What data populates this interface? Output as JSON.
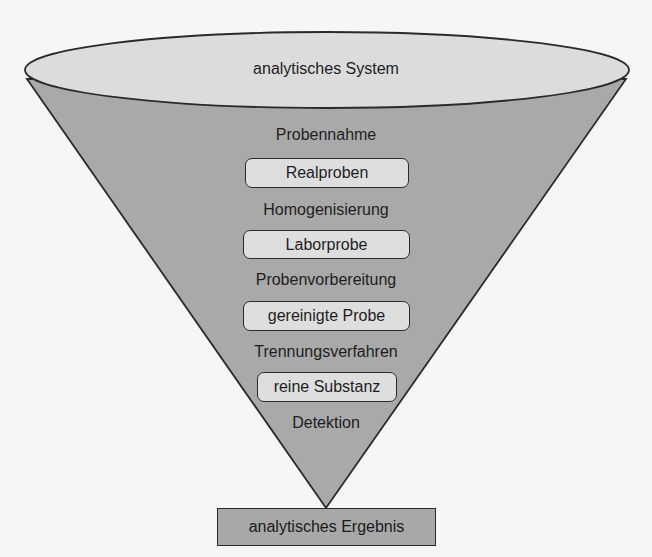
{
  "diagram": {
    "type": "funnel",
    "colors": {
      "background": "#f6f6f6",
      "funnel_fill": "#a9a9a9",
      "rim_fill": "#dcdcdc",
      "box_fill": "#dedede",
      "result_fill": "#a8a8a8",
      "outline": "#2a2a2a"
    },
    "top": {
      "label": "analytisches System"
    },
    "steps": [
      {
        "process": "Probennahme",
        "product": "Realproben"
      },
      {
        "process": "Homogenisierung",
        "product": "Laborprobe"
      },
      {
        "process": "Probenvorbereitung",
        "product": "gereinigte Probe"
      },
      {
        "process": "Trennungsverfahren",
        "product": "reine Substanz"
      },
      {
        "process": "Detektion",
        "product": null
      }
    ],
    "result": {
      "label": "analytisches Ergebnis"
    }
  }
}
